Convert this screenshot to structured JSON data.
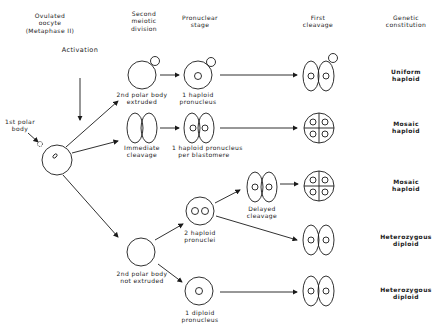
{
  "headers": {
    "oocyte": [
      "Ovulated",
      "oocyte",
      "(Metaphase II)"
    ],
    "second_meiotic": [
      "Second",
      "meiotic",
      "division"
    ],
    "pronuclear": [
      "Pronuclear",
      "stage"
    ],
    "first_cleavage": [
      "First",
      "cleavage"
    ],
    "genetic": [
      "Genetic",
      "constitution"
    ]
  },
  "labels": {
    "activation": "Activation",
    "first_polar_body": [
      "1st polar",
      "body"
    ],
    "pb_extruded": [
      "2nd polar body",
      "extruded"
    ],
    "one_haploid_pronucleus": [
      "1 haploid",
      "pronucleus"
    ],
    "immediate_cleavage": [
      "Immediate",
      "cleavage"
    ],
    "haploid_per_blastomere": [
      "1 haploid pronucleus",
      "per blastomere"
    ],
    "delayed_cleavage": [
      "Delayed",
      "cleavage"
    ],
    "two_haploid_pronuclei": [
      "2 haploid",
      "pronuclei"
    ],
    "pb_not_extruded": [
      "2nd polar body",
      "not extruded"
    ],
    "one_diploid_pronucleus": [
      "1 diploid",
      "pronucleus"
    ]
  },
  "outcomes": [
    [
      "Uniform",
      "haploid"
    ],
    [
      "Mosaic",
      "haploid"
    ],
    [
      "Mosaic",
      "haploid"
    ],
    [
      "Heterozygous",
      "diploid"
    ],
    [
      "Heterozygous",
      "diploid"
    ]
  ],
  "colors": {
    "line": "#1a1a1a",
    "background": "#ffffff"
  }
}
